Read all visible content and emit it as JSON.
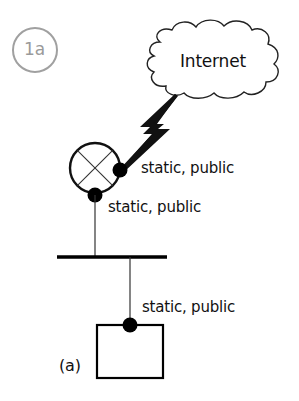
{
  "diagram": {
    "badge": {
      "label": "1a",
      "color": "#9a9a9a"
    },
    "cloud": {
      "label": "Internet"
    },
    "router": {
      "wan_address_label": "static, public",
      "lan_address_label": "static, public"
    },
    "host": {
      "address_label": "static, public",
      "caption": "(a)"
    },
    "colors": {
      "stroke": "#111111",
      "badge": "#9a9a9a",
      "background": "#ffffff"
    }
  }
}
